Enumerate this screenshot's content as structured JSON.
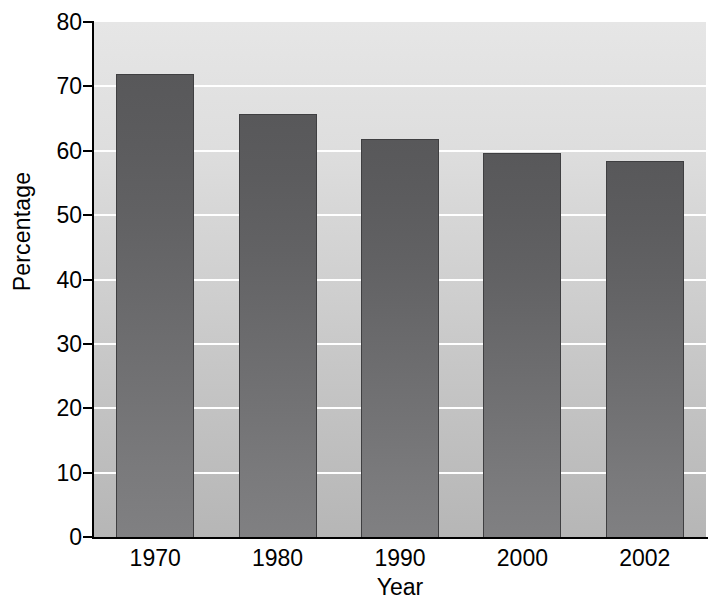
{
  "chart_data": {
    "type": "bar",
    "title": "",
    "subtitle": "",
    "xlabel": "Year",
    "ylabel": "Percentage",
    "categories": [
      "1970",
      "1980",
      "1990",
      "2000",
      "2002"
    ],
    "values": [
      72.0,
      65.7,
      61.8,
      59.6,
      58.4
    ],
    "series": [
      {
        "name": "Percentage",
        "values": [
          72.0,
          65.7,
          61.8,
          59.6,
          58.4
        ]
      }
    ],
    "ylim": [
      0,
      80
    ],
    "ytick_labels": [
      "0",
      "10",
      "20",
      "30",
      "40",
      "50",
      "60",
      "70",
      "80"
    ],
    "ytick_values": [
      0,
      10,
      20,
      30,
      40,
      50,
      60,
      70,
      80
    ],
    "xtick_labels": [
      "1970",
      "1980",
      "1990",
      "2000",
      "2002"
    ],
    "grid": true,
    "grid_axis": "y",
    "grid_color": "#ffffff",
    "legend": false,
    "legend_position": "none",
    "bar_color": "#6a6a6c",
    "plot_background": "#d2d2d2",
    "axis_color": "#000000",
    "annotations": []
  }
}
